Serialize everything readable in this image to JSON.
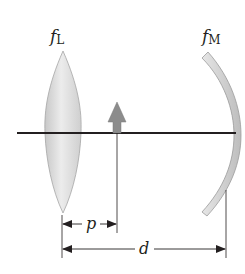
{
  "labels": {
    "lens_symbol": "f",
    "lens_subscript": "L",
    "mirror_symbol": "f",
    "mirror_subscript": "M",
    "object_distance": "p",
    "separation": "d"
  },
  "colors": {
    "axis": "#231f20",
    "lens_fill": "#d9d9d9",
    "lens_edge": "#a6a6a6",
    "mirror_fill": "#cfcfcf",
    "mirror_edge": "#9a9a9a",
    "object_arrow": "#8c8c8c",
    "dimension_lines": "#231f20"
  },
  "elements": {
    "lens": "converging-lens",
    "mirror": "concave-mirror",
    "object": "upright-object-arrow"
  }
}
